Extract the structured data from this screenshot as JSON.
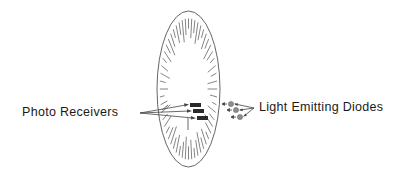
{
  "diagram": {
    "labels": {
      "photo_receivers": "Photo Receivers",
      "light_emitting_diodes": "Light Emitting Diodes"
    },
    "colors": {
      "line": "#555555",
      "receiver_fill": "#2a2a2a",
      "led_fill": "#8c8c8c",
      "background": "#ffffff"
    },
    "ellipse": {
      "cx": 188.5,
      "cy": 89,
      "rx": 31.5,
      "ry": 78
    },
    "receivers": [
      {
        "x": 190,
        "y": 103,
        "w": 11,
        "h": 4
      },
      {
        "x": 193,
        "y": 109,
        "w": 11,
        "h": 4
      },
      {
        "x": 197,
        "y": 116,
        "w": 11,
        "h": 4
      }
    ],
    "leds": [
      {
        "cx": 231,
        "cy": 104,
        "r": 2.6
      },
      {
        "cx": 236,
        "cy": 110,
        "r": 2.6
      },
      {
        "cx": 240,
        "cy": 117,
        "r": 2.6
      }
    ]
  }
}
